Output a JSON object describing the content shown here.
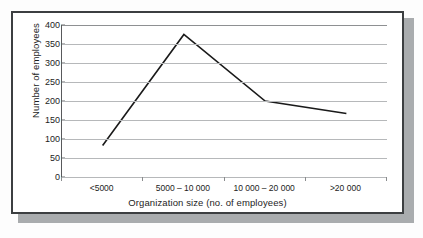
{
  "figure": {
    "frame_color": "#3c3f41",
    "shadow_color": "#a9acae",
    "background_color": "#ffffff"
  },
  "chart_data": {
    "type": "line",
    "title": "",
    "subtitle": "",
    "xlabel": "Organization size (no. of employees)",
    "ylabel": "Number of employees",
    "categories": [
      "<5000",
      "5000 – 10 000",
      "10 000 – 20 000",
      ">20 000"
    ],
    "values": [
      83,
      375,
      200,
      167
    ],
    "series": [
      {
        "name": "Number of employees",
        "values": [
          83,
          375,
          200,
          167
        ],
        "color": "#1a1a1a"
      }
    ],
    "ylim": [
      0,
      400
    ],
    "yticks": [
      0,
      50,
      100,
      150,
      200,
      250,
      300,
      350,
      400
    ],
    "ytick_labels": [
      "0",
      "50",
      "100",
      "150",
      "200",
      "250",
      "300",
      "350",
      "400"
    ],
    "grid": true,
    "grid_axis": "y",
    "grid_color": "#b6b8ba",
    "legend": false,
    "legend_position": "none",
    "markers": false,
    "line_width": 1.6
  }
}
